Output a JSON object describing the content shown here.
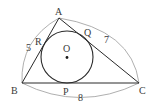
{
  "figure": {
    "colors": {
      "line": "#2a2a2a",
      "arc": "#9a9a9a",
      "text": "#3a3a3a",
      "background": "#ffffff"
    },
    "vertices": {
      "A": {
        "label": "A",
        "x": 59,
        "y": 18
      },
      "B": {
        "label": "B",
        "x": 22,
        "y": 83
      },
      "C": {
        "label": "C",
        "x": 139,
        "y": 83
      }
    },
    "incircle": {
      "center_label": "O",
      "cx": 67,
      "cy": 57,
      "r": 26
    },
    "tangent_points": {
      "P": {
        "label": "P"
      },
      "Q": {
        "label": "Q"
      },
      "R": {
        "label": "R"
      }
    },
    "side_lengths": {
      "AB": "5",
      "AC": "7",
      "BC": "8"
    }
  }
}
